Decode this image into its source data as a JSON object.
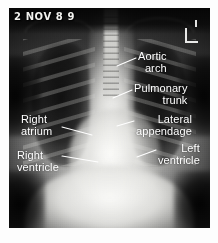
{
  "image": {
    "kind": "chest-radiograph",
    "view": "PA chest X-ray",
    "date_stamp": "2 NOV 8 9",
    "laterality_marker": "L",
    "label_color": "#ffffff",
    "plate_background": "#0a0a0a",
    "page_background": "#ffffff"
  },
  "annotations": [
    {
      "id": "aortic-arch",
      "line1": "Aortic",
      "line2": "arch",
      "side": "right"
    },
    {
      "id": "pulmonary-trunk",
      "line1": "Pulmonary",
      "line2": "trunk",
      "side": "right"
    },
    {
      "id": "lateral-appendage",
      "line1": "Lateral",
      "line2": "appendage",
      "side": "right"
    },
    {
      "id": "left-ventricle",
      "line1": "Left",
      "line2": "ventricle",
      "side": "right"
    },
    {
      "id": "right-atrium",
      "line1": "Right",
      "line2": "atrium",
      "side": "left"
    },
    {
      "id": "right-ventricle",
      "line1": "Right",
      "line2": "ventricle",
      "side": "left"
    }
  ]
}
